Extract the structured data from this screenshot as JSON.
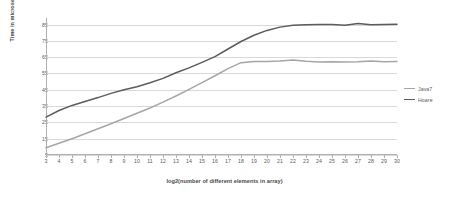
{
  "chart_data": {
    "type": "line",
    "title": "",
    "xlabel": "log2(number of different elements in array)",
    "ylabel": "Time in microseconds",
    "x": [
      3,
      4,
      5,
      6,
      7,
      8,
      9,
      10,
      11,
      12,
      13,
      14,
      15,
      16,
      17,
      18,
      19,
      20,
      21,
      22,
      23,
      24,
      25,
      26,
      27,
      28,
      29,
      30
    ],
    "xticklabels": [
      "3",
      "4",
      "5",
      "6",
      "7",
      "8",
      "9",
      "10",
      "11",
      "12",
      "13",
      "14",
      "15",
      "16",
      "17",
      "18",
      "19",
      "20",
      "21",
      "22",
      "23",
      "24",
      "25",
      "26",
      "27",
      "28",
      "29",
      "30"
    ],
    "yticklabels": [
      "5",
      "15",
      "25",
      "35",
      "45",
      "55",
      "65",
      "75",
      "85"
    ],
    "yticks": [
      5,
      15,
      25,
      35,
      45,
      55,
      65,
      75,
      85
    ],
    "xlim": [
      3,
      30
    ],
    "ylim": [
      5,
      89
    ],
    "grid": true,
    "legend_position": "right",
    "series": [
      {
        "name": "Java7",
        "color": "#a6a6a6",
        "values": [
          9.4,
          12.2,
          15.0,
          18.0,
          21.1,
          24.2,
          27.4,
          30.6,
          33.8,
          37.4,
          41.2,
          45.2,
          49.4,
          53.6,
          58.0,
          61.6,
          62.4,
          62.4,
          62.6,
          63.3,
          62.5,
          62.0,
          62.1,
          62.0,
          62.1,
          62.6,
          62.2,
          62.4
        ]
      },
      {
        "name": "Hoare",
        "color": "#5c5c5c",
        "values": [
          28.2,
          32.3,
          35.4,
          37.8,
          40.2,
          42.8,
          45.0,
          46.8,
          49.3,
          52.0,
          55.4,
          58.4,
          61.8,
          65.3,
          70.0,
          74.6,
          78.4,
          81.4,
          83.4,
          84.5,
          84.8,
          85.0,
          85.0,
          84.5,
          85.6,
          84.9,
          85.0,
          85.2
        ]
      }
    ]
  },
  "legend": {
    "entries": [
      {
        "label": "Java7",
        "color": "#a6a6a6"
      },
      {
        "label": "Hoare",
        "color": "#5c5c5c"
      }
    ]
  }
}
